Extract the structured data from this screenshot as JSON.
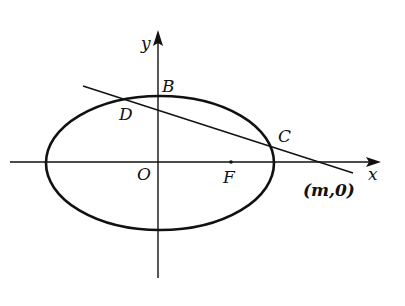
{
  "diagram": {
    "type": "ellipse-line-figure",
    "axes": {
      "x_label": "x",
      "y_label": "y",
      "origin_label": "O"
    },
    "points": {
      "B": "B",
      "D": "D",
      "C": "C",
      "F": "F",
      "intercept": "(m,0)"
    },
    "colors": {
      "stroke": "#111111",
      "background": "#ffffff"
    }
  }
}
